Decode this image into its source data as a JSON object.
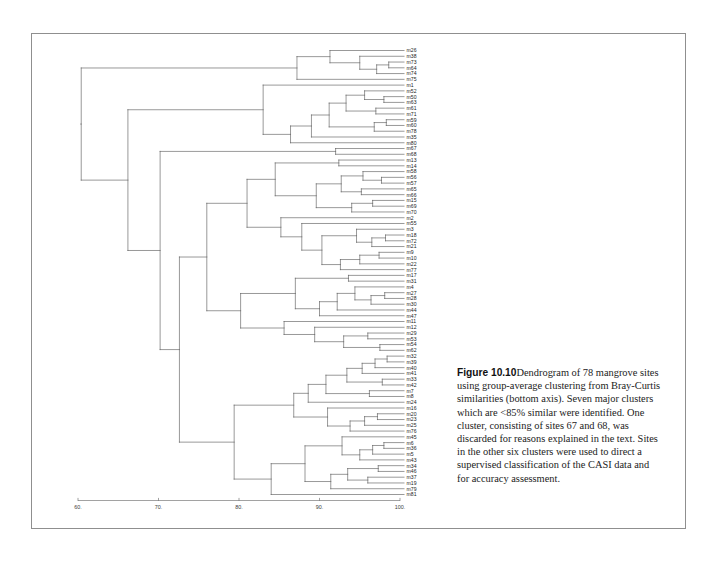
{
  "figure": {
    "number_label": "Figure 10.10",
    "caption_text": "Dendrogram of 78 mangrove sites using group-average clustering from Bray-Curtis similarities (bottom axis). Seven major clusters which are <85% similar were identified. One cluster, consisting of sites 67 and 68, was discarded for reasons explained in the text. Sites in the other six clusters were used to direct a supervised classification of the CASI data and for accuracy assessment."
  },
  "chart_data": {
    "type": "dendrogram",
    "title": "Dendrogram of 78 mangrove sites",
    "xlabel": "Bray-Curtis similarity",
    "ylabel": "",
    "xlim": [
      57,
      101.5
    ],
    "grid": false,
    "legend": "none",
    "orientation": "horizontal-right-leaves",
    "linkage": "group-average",
    "similarity_measure": "Bray-Curtis",
    "n_leaves": 78,
    "axis_ticks": [
      60,
      70,
      80,
      90,
      100
    ],
    "axis_tick_labels": [
      "60.",
      "70.",
      "80.",
      "90.",
      "100."
    ],
    "cluster_threshold": 85,
    "leaves": [
      "m26",
      "m38",
      "m73",
      "m64",
      "m74",
      "m75",
      "m1",
      "m52",
      "m50",
      "m63",
      "m61",
      "m71",
      "m59",
      "m60",
      "m78",
      "m35",
      "m80",
      "m67",
      "m68",
      "m13",
      "m14",
      "m58",
      "m56",
      "m57",
      "m65",
      "m66",
      "m15",
      "m69",
      "m70",
      "m2",
      "m55",
      "m3",
      "m18",
      "m72",
      "m21",
      "m9",
      "m10",
      "m22",
      "m77",
      "m17",
      "m31",
      "m4",
      "m27",
      "m28",
      "m30",
      "m44",
      "m47",
      "m11",
      "m12",
      "m29",
      "m53",
      "m54",
      "m62",
      "m32",
      "m39",
      "m40",
      "m41",
      "m33",
      "m42",
      "m7",
      "m8",
      "m24",
      "m16",
      "m20",
      "m23",
      "m25",
      "m76",
      "m45",
      "m6",
      "m36",
      "m5",
      "m43",
      "m34",
      "m46",
      "m37",
      "m19",
      "m79",
      "m81"
    ],
    "merges": [
      {
        "id": "n1",
        "left": "m73",
        "right": "m64",
        "height": 98.6
      },
      {
        "id": "n2",
        "left": "n1",
        "right": "m74",
        "height": 97.1
      },
      {
        "id": "n3",
        "left": "m38",
        "right": "n2",
        "height": 95.0
      },
      {
        "id": "n4",
        "left": "m26",
        "right": "n3",
        "height": 91.3
      },
      {
        "id": "n5",
        "left": "n4",
        "right": "m75",
        "height": 87.2
      },
      {
        "id": "n6",
        "left": "m50",
        "right": "m63",
        "height": 98.0
      },
      {
        "id": "n7",
        "left": "m52",
        "right": "n6",
        "height": 95.6
      },
      {
        "id": "n8",
        "left": "m61",
        "right": "m71",
        "height": 97.0
      },
      {
        "id": "n9",
        "left": "n7",
        "right": "n8",
        "height": 93.3
      },
      {
        "id": "n10",
        "left": "m59",
        "right": "m60",
        "height": 98.3
      },
      {
        "id": "n11",
        "left": "n10",
        "right": "m78",
        "height": 96.8
      },
      {
        "id": "n12",
        "left": "n9",
        "right": "n11",
        "height": 91.2
      },
      {
        "id": "n13",
        "left": "n12",
        "right": "m35",
        "height": 89.0
      },
      {
        "id": "n14",
        "left": "n13",
        "right": "m80",
        "height": 86.4
      },
      {
        "id": "n15",
        "left": "m1",
        "right": "n14",
        "height": 83.0
      },
      {
        "id": "n16",
        "left": "m67",
        "right": "m68",
        "height": 92.0
      },
      {
        "id": "n17",
        "left": "m56",
        "right": "m57",
        "height": 97.7
      },
      {
        "id": "n18",
        "left": "m58",
        "right": "n17",
        "height": 95.4
      },
      {
        "id": "n19",
        "left": "m65",
        "right": "m66",
        "height": 95.2
      },
      {
        "id": "n20",
        "left": "n18",
        "right": "n19",
        "height": 92.7
      },
      {
        "id": "n21",
        "left": "m15",
        "right": "m69",
        "height": 96.6
      },
      {
        "id": "n22",
        "left": "n21",
        "right": "m70",
        "height": 94.0
      },
      {
        "id": "n23",
        "left": "n20",
        "right": "n22",
        "height": 89.6
      },
      {
        "id": "n24",
        "left": "m13",
        "right": "m14",
        "height": 92.4
      },
      {
        "id": "n25",
        "left": "n24",
        "right": "n23",
        "height": 84.5
      },
      {
        "id": "n26",
        "left": "m18",
        "right": "m72",
        "height": 98.2
      },
      {
        "id": "n27",
        "left": "n26",
        "right": "m21",
        "height": 96.5
      },
      {
        "id": "n28",
        "left": "m3",
        "right": "n27",
        "height": 94.6
      },
      {
        "id": "n29",
        "left": "m9",
        "right": "m10",
        "height": 97.4
      },
      {
        "id": "n30",
        "left": "n29",
        "right": "m22",
        "height": 95.0
      },
      {
        "id": "n31",
        "left": "n30",
        "right": "m77",
        "height": 92.6
      },
      {
        "id": "n32",
        "left": "n28",
        "right": "n31",
        "height": 90.3
      },
      {
        "id": "n33",
        "left": "m55",
        "right": "n32",
        "height": 87.8
      },
      {
        "id": "n34",
        "left": "m2",
        "right": "n33",
        "height": 85.2
      },
      {
        "id": "n35",
        "left": "n25",
        "right": "n34",
        "height": 81.0
      },
      {
        "id": "n36",
        "left": "m27",
        "right": "m28",
        "height": 98.1
      },
      {
        "id": "n37",
        "left": "n36",
        "right": "m30",
        "height": 96.4
      },
      {
        "id": "n38",
        "left": "m4",
        "right": "n37",
        "height": 94.4
      },
      {
        "id": "n39",
        "left": "n38",
        "right": "m44",
        "height": 92.2
      },
      {
        "id": "n40",
        "left": "n39",
        "right": "m47",
        "height": 90.0
      },
      {
        "id": "n41",
        "left": "m17",
        "right": "m31",
        "height": 93.6
      },
      {
        "id": "n42",
        "left": "n41",
        "right": "n40",
        "height": 87.0
      },
      {
        "id": "n43",
        "left": "m29",
        "right": "m53",
        "height": 96.0
      },
      {
        "id": "n44",
        "left": "m54",
        "right": "m62",
        "height": 97.5
      },
      {
        "id": "n45",
        "left": "n43",
        "right": "n44",
        "height": 93.0
      },
      {
        "id": "n46",
        "left": "m12",
        "right": "n45",
        "height": 89.4
      },
      {
        "id": "n47",
        "left": "m11",
        "right": "n46",
        "height": 85.6
      },
      {
        "id": "n48",
        "left": "n42",
        "right": "n47",
        "height": 80.2
      },
      {
        "id": "n49",
        "left": "n35",
        "right": "n48",
        "height": 76.0
      },
      {
        "id": "n50",
        "left": "m32",
        "right": "m39",
        "height": 98.4
      },
      {
        "id": "n51",
        "left": "n50",
        "right": "m40",
        "height": 96.9
      },
      {
        "id": "n52",
        "left": "n51",
        "right": "m41",
        "height": 95.3
      },
      {
        "id": "n53",
        "left": "m33",
        "right": "m42",
        "height": 97.8
      },
      {
        "id": "n54",
        "left": "n52",
        "right": "n53",
        "height": 93.4
      },
      {
        "id": "n55",
        "left": "m7",
        "right": "m8",
        "height": 96.2
      },
      {
        "id": "n56",
        "left": "n54",
        "right": "n55",
        "height": 90.8
      },
      {
        "id": "n57",
        "left": "n56",
        "right": "m24",
        "height": 88.6
      },
      {
        "id": "n58",
        "left": "m20",
        "right": "m23",
        "height": 97.2
      },
      {
        "id": "n59",
        "left": "n58",
        "right": "m25",
        "height": 95.6
      },
      {
        "id": "n60",
        "left": "n59",
        "right": "m76",
        "height": 93.8
      },
      {
        "id": "n61",
        "left": "m16",
        "right": "n60",
        "height": 91.0
      },
      {
        "id": "n62",
        "left": "n57",
        "right": "n61",
        "height": 86.8
      },
      {
        "id": "n63",
        "left": "m6",
        "right": "m36",
        "height": 98.0
      },
      {
        "id": "n64",
        "left": "n63",
        "right": "m5",
        "height": 96.6
      },
      {
        "id": "n65",
        "left": "n64",
        "right": "m43",
        "height": 95.0
      },
      {
        "id": "n66",
        "left": "m45",
        "right": "n65",
        "height": 92.8
      },
      {
        "id": "n67",
        "left": "m34",
        "right": "m46",
        "height": 97.3
      },
      {
        "id": "n68",
        "left": "m37",
        "right": "m19",
        "height": 96.0
      },
      {
        "id": "n69",
        "left": "n67",
        "right": "n68",
        "height": 93.5
      },
      {
        "id": "n70",
        "left": "n69",
        "right": "m79",
        "height": 91.4
      },
      {
        "id": "n71",
        "left": "n66",
        "right": "n70",
        "height": 88.2
      },
      {
        "id": "n72",
        "left": "n71",
        "right": "m81",
        "height": 84.0
      },
      {
        "id": "n73",
        "left": "n62",
        "right": "n72",
        "height": 79.4
      },
      {
        "id": "n74",
        "left": "n49",
        "right": "n73",
        "height": 72.6
      },
      {
        "id": "n75",
        "left": "n16",
        "right": "n74",
        "height": 70.2
      },
      {
        "id": "n76",
        "left": "n15",
        "right": "n75",
        "height": 66.2
      },
      {
        "id": "n77",
        "left": "n5",
        "right": "n76",
        "height": 60.4
      }
    ]
  }
}
